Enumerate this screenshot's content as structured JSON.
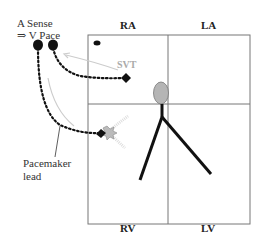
{
  "chambers": {
    "ra": "RA",
    "la": "LA",
    "rv": "RV",
    "lv": "LV"
  },
  "annotations": {
    "a_sense_line1": "A Sense",
    "a_sense_line2": "⇒ V Pace",
    "svt": "SVT",
    "pacemaker_line1": "Pacemaker",
    "pacemaker_line2": "lead"
  },
  "colors": {
    "ink": "#111111",
    "box_line": "#666666",
    "svt_text": "#aaaaaa",
    "oval_fill": "#b5b5b5",
    "arrow": "#c8c8c8"
  }
}
